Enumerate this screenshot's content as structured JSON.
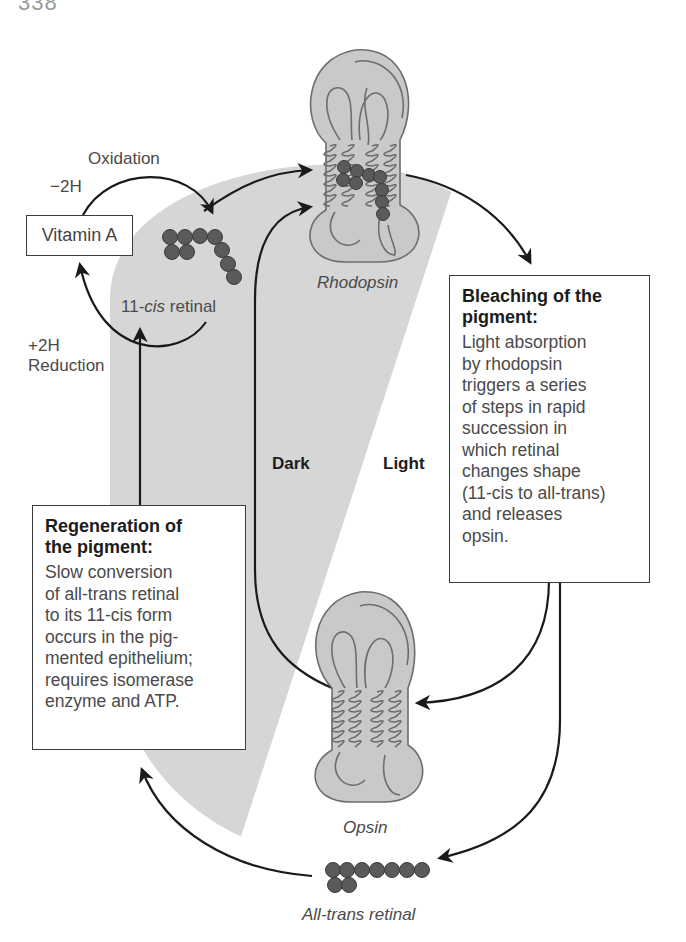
{
  "header_fragment": {
    "page_number_partial": "338",
    "running_title_partial": "Chapter heading (cut off)"
  },
  "diagram": {
    "type": "visual-cycle",
    "colors": {
      "dark_region": "#d6d6d6",
      "protein_fill": "#c9c9c9",
      "protein_outline": "#6d6d6d",
      "retinal_bead": "#5a5a5a",
      "arrow": "#1a1a1a",
      "text": "#4a4a4a"
    },
    "labels": {
      "oxidation": "Oxidation",
      "minus_2h": "−2H",
      "plus_2h": "+2H",
      "reduction": "Reduction",
      "vitamin_a": "Vitamin A",
      "cis_retinal_prefix": "11-",
      "cis_retinal_italic": "cis",
      "cis_retinal_suffix": " retinal",
      "rhodopsin": "Rhodopsin",
      "opsin": "Opsin",
      "all_trans_prefix": "All",
      "all_trans_suffix": "-trans retinal",
      "dark": "Dark",
      "light": "Light"
    },
    "bleaching_box": {
      "title_line1": "Bleaching of the",
      "title_line2": "pigment:",
      "body_lines": [
        "Light absorption",
        "by rhodopsin",
        "triggers a series",
        "of steps in rapid",
        "succession in",
        "which retinal",
        "changes shape",
        "(11-cis to all-trans)",
        "and releases",
        "opsin."
      ]
    },
    "regeneration_box": {
      "title_line1": "Regeneration of",
      "title_line2": "the pigment:",
      "body_lines": [
        "Slow conversion",
        "of all-trans retinal",
        "to its 11-cis form",
        "occurs in the pig-",
        "mented epithelium;",
        "requires  isomerase",
        "enzyme and ATP."
      ]
    }
  }
}
